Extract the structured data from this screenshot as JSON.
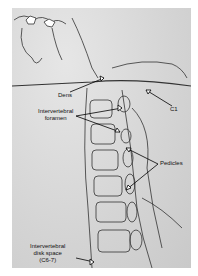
{
  "figure": {
    "type": "cervical-spine-radiograph-lateral",
    "labels": {
      "dens": "Dens",
      "c1": "C1",
      "intervertebral_foramen_line1": "Intervertebral",
      "intervertebral_foramen_line2": "foramen",
      "pedicles": "Pedicles",
      "disk_space_line1": "Intervertebral",
      "disk_space_line2": "disk space",
      "disk_space_line3": "(C6-7)"
    }
  }
}
